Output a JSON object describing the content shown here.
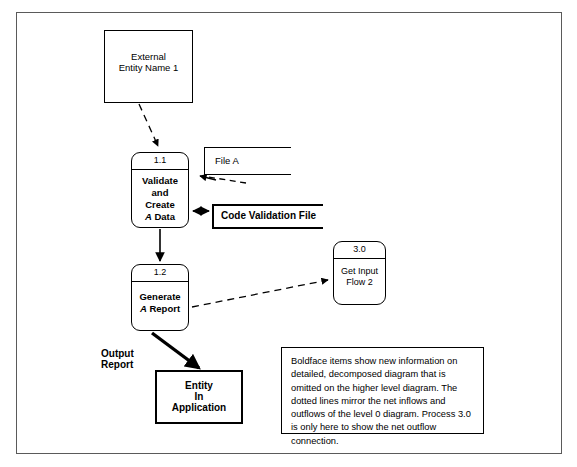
{
  "diagram": {
    "frame": {
      "border_color": "#5a5a5a"
    }
  },
  "external_entity": {
    "label": "External\nEntity Name 1"
  },
  "processes": [
    {
      "id": "1.1",
      "number": "1.1",
      "line1": "Validate",
      "line2": "and",
      "line3": "Create",
      "line4_italic": "A",
      "line4_rest": " Data",
      "bold": true
    },
    {
      "id": "1.2",
      "number": "1.2",
      "line1": "Generate",
      "line2_italic": "A",
      "line2_rest": " Report",
      "bold": true
    },
    {
      "id": "3.0",
      "number": "3.0",
      "line1": "Get Input",
      "line2": "Flow 2",
      "bold": false
    }
  ],
  "data_stores": [
    {
      "id": "file-a",
      "label": "File A",
      "bold": false
    },
    {
      "id": "code-validation-file",
      "label": "Code Validation File",
      "bold": true
    }
  ],
  "entity_in_application": {
    "label": "Entity\nIn\nApplication"
  },
  "flows": [
    {
      "id": "output-report",
      "label": "Output\nReport",
      "style": "thick-solid"
    },
    {
      "id": "entity-to-process-11",
      "label": "",
      "style": "dashed"
    },
    {
      "id": "process-11-to-file-a",
      "label": "",
      "style": "dashed"
    },
    {
      "id": "process-11-to-code-file",
      "label": "",
      "style": "double-arrow"
    },
    {
      "id": "process-11-to-process-12",
      "label": "",
      "style": "solid"
    },
    {
      "id": "process-12-to-process-30",
      "label": "",
      "style": "dashed"
    }
  ],
  "note": {
    "text": "Boldface items show new information on detailed, decomposed diagram that is omitted on the higher level diagram.  The dotted lines mirror the net inflows and outflows of the level 0 diagram. Process 3.0 is only here to show the net outflow connection."
  }
}
